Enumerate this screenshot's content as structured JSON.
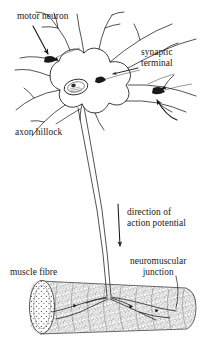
{
  "figure": {
    "kind": "biology-diagram",
    "style": "hand-drawn ink line art",
    "background_color": "#ffffff",
    "ink_color": "#1a1a1a",
    "stipple_color": "#555555"
  },
  "labels": {
    "motor_neuron": "motor neuron",
    "synaptic_terminal_line1": "synaptic",
    "synaptic_terminal_line2": "terminal",
    "axon_hillock": "axon hillock",
    "direction_line1": "direction of",
    "direction_line2": "action potential",
    "neuromuscular_line1": "neuromuscular",
    "neuromuscular_line2": "junction",
    "muscle_fibre": "muscle fibre"
  },
  "annotations": {
    "arrow_motor_neuron": "arrow pointing down-right to a presynaptic bouton on a dendrite",
    "arrow_synaptic_terminal_upper": "straight arrow pointing left to a synaptic terminal on the upper right dendrite",
    "arrow_synaptic_terminal_lower": "curved arrow pointing up-left to a dark synaptic terminal",
    "leader_axon_hillock": "leader line from text up-right to the axon hillock region",
    "arrow_action_potential": "long vertical arrow pointing down alongside the axon",
    "leader_neuromuscular": "leader line from text down-left to the motor end plate on the muscle"
  },
  "structures": {
    "cell_body": "soma with nucleus",
    "nucleus": "oval nucleus with nucleolus",
    "dendrites": "multiple branching dendrites radiating from the soma",
    "axon": "single long axon descending from the axon hillock to the muscle",
    "muscle_fibre": "striated cylindrical muscle fibre with cross-striations and cut end showing myofibrils",
    "end_plate": "branching axon terminals spreading over the muscle surface"
  }
}
